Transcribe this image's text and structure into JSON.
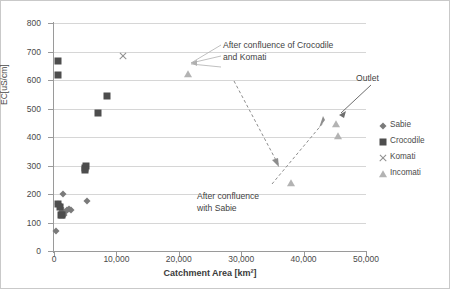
{
  "chart_data": {
    "type": "scatter",
    "title": "",
    "xlabel": "Catchment Area [km²]",
    "ylabel": "EC[uS/cm]",
    "xlim": [
      0,
      50000
    ],
    "ylim": [
      0,
      800
    ],
    "xticks": [
      0,
      10000,
      20000,
      30000,
      40000,
      50000
    ],
    "xtick_labels": [
      "0",
      "10,000",
      "20,000",
      "30,000",
      "40,000",
      "50,000"
    ],
    "yticks": [
      0,
      100,
      200,
      300,
      400,
      500,
      600,
      700,
      800
    ],
    "ytick_labels": [
      "0",
      "100",
      "200",
      "300",
      "400",
      "500",
      "600",
      "700",
      "800"
    ],
    "grid": "horizontal",
    "legend_position": "right",
    "series": [
      {
        "name": "Sabie",
        "marker": "diamond",
        "color": "#7a7a7a",
        "points": [
          {
            "x": 300,
            "y": 70
          },
          {
            "x": 1500,
            "y": 200
          },
          {
            "x": 700,
            "y": 165
          },
          {
            "x": 900,
            "y": 160
          },
          {
            "x": 1100,
            "y": 150
          },
          {
            "x": 1250,
            "y": 140
          },
          {
            "x": 1400,
            "y": 132
          },
          {
            "x": 1600,
            "y": 128
          },
          {
            "x": 1800,
            "y": 138
          },
          {
            "x": 2100,
            "y": 143
          },
          {
            "x": 2400,
            "y": 146
          },
          {
            "x": 2700,
            "y": 144
          },
          {
            "x": 5300,
            "y": 175
          }
        ]
      },
      {
        "name": "Crocodile",
        "marker": "square",
        "color": "#4d4d4d",
        "points": [
          {
            "x": 600,
            "y": 668
          },
          {
            "x": 600,
            "y": 617
          },
          {
            "x": 700,
            "y": 165
          },
          {
            "x": 900,
            "y": 155
          },
          {
            "x": 1200,
            "y": 128
          },
          {
            "x": 1300,
            "y": 126
          },
          {
            "x": 4900,
            "y": 290
          },
          {
            "x": 5100,
            "y": 300
          },
          {
            "x": 5000,
            "y": 283
          },
          {
            "x": 7000,
            "y": 485
          },
          {
            "x": 8500,
            "y": 545
          }
        ]
      },
      {
        "name": "Komati",
        "marker": "x",
        "color": "#8f8f8f",
        "points": [
          {
            "x": 11000,
            "y": 683
          }
        ]
      },
      {
        "name": "Incomati",
        "marker": "triangle",
        "color": "#b3b3b3",
        "points": [
          {
            "x": 21500,
            "y": 620
          },
          {
            "x": 38000,
            "y": 240
          },
          {
            "x": 45200,
            "y": 445
          },
          {
            "x": 45500,
            "y": 405
          }
        ]
      }
    ],
    "annotations": [
      {
        "id": "after-confluence-crocodile-komati",
        "text": "After confluence of Crocodile and Komati",
        "points_to": {
          "x": 21500,
          "y": 620
        }
      },
      {
        "id": "after-confluence-sabie",
        "text": "After confluence with Sabie",
        "points_to": {
          "x": 38000,
          "y": 240
        }
      },
      {
        "id": "outlet",
        "text": "Outlet",
        "points_to": {
          "x": 45200,
          "y": 445
        }
      }
    ]
  },
  "legend": {
    "items": [
      {
        "label": "Sabie",
        "marker": "diamond"
      },
      {
        "label": "Crocodile",
        "marker": "square"
      },
      {
        "label": "Komati",
        "marker": "x"
      },
      {
        "label": "Incomati",
        "marker": "triangle"
      }
    ]
  },
  "annotation_text": {
    "crocodile_komati": "After confluence of Crocodile and Komati",
    "sabie": "After confluence with Sabie",
    "outlet": "Outlet"
  },
  "axes": {
    "x_title": "Catchment Area [km²]",
    "y_title": "EC[uS/cm]"
  }
}
